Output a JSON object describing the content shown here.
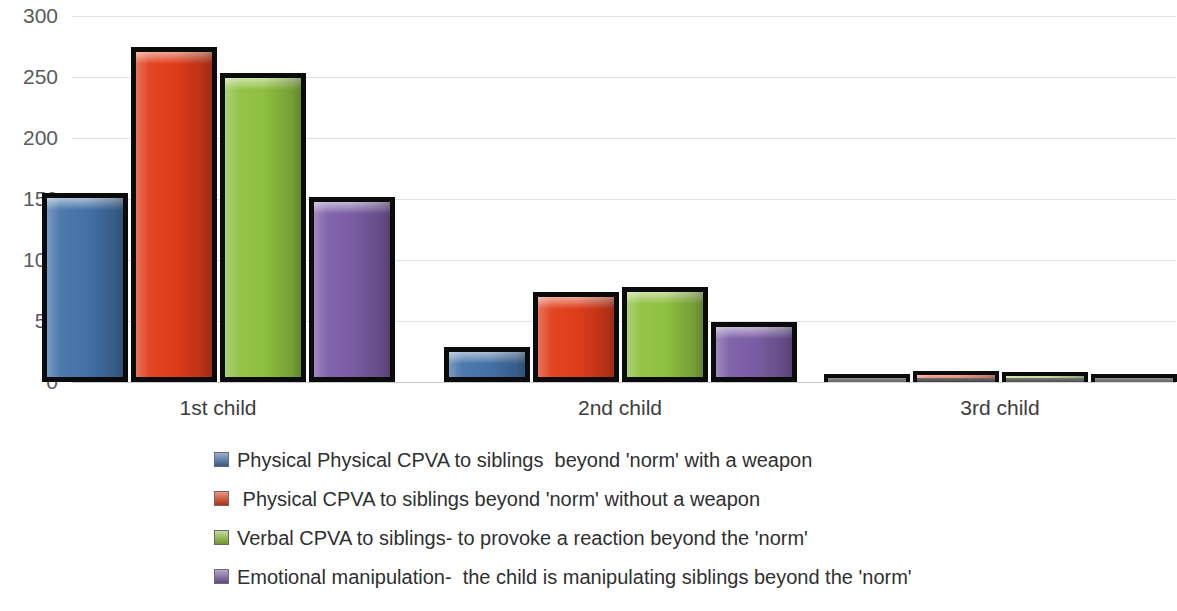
{
  "chart_data": {
    "type": "bar",
    "title": "",
    "subtitle": "",
    "xlabel": "",
    "ylabel": "",
    "categories": [
      "1st child",
      "2nd child",
      "3rd child"
    ],
    "ylim": [
      0,
      300
    ],
    "yticks": [
      0,
      50,
      100,
      150,
      200,
      250,
      300
    ],
    "ytick_labels": [
      "0",
      "50",
      "100",
      "150",
      "200",
      "250",
      "300"
    ],
    "grid": true,
    "legend_position": "bottom",
    "series": [
      {
        "name": "Physical Physical CPVA to siblings  beyond 'norm' with a weapon",
        "color": "#4472a8",
        "values": [
          155,
          29,
          4
        ]
      },
      {
        "name": " Physical CPVA to siblings beyond 'norm' without a weapon",
        "color": "#e03d1a",
        "values": [
          275,
          74,
          9
        ]
      },
      {
        "name": "Verbal CPVA to siblings- to provoke a reaction beyond the 'norm'",
        "color": "#8fc040",
        "values": [
          253,
          78,
          8
        ]
      },
      {
        "name": "Emotional manipulation-  the child is manipulating siblings beyond the 'norm'",
        "color": "#7b5da5",
        "values": [
          152,
          49,
          5
        ]
      }
    ]
  },
  "axis": {
    "y_labels": [
      "300",
      "250",
      "200",
      "150",
      "100",
      "50",
      "0"
    ]
  },
  "legend": {
    "items": [
      {
        "label": "Physical Physical CPVA to siblings  beyond 'norm' with a weapon",
        "color": "#4472a8"
      },
      {
        "label": " Physical CPVA to siblings beyond 'norm' without a weapon",
        "color": "#e03d1a"
      },
      {
        "label": "Verbal CPVA to siblings- to provoke a reaction beyond the 'norm'",
        "color": "#8fc040"
      },
      {
        "label": "Emotional manipulation-  the child is manipulating siblings beyond the 'norm'",
        "color": "#7b5da5"
      }
    ]
  }
}
